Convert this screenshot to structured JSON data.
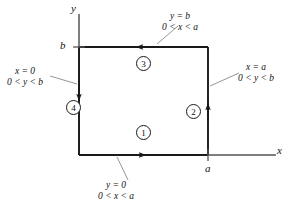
{
  "figure": {
    "colors": {
      "ink": "#111111",
      "line": "#1a1a1a",
      "leader": "#777777",
      "background": "#ffffff"
    }
  },
  "axes": {
    "y_label": "y",
    "x_label": "x"
  },
  "ticks": {
    "y_tick": "b",
    "x_tick": "a"
  },
  "segments": [
    {
      "number": "1",
      "edge": "bottom",
      "direction": "right",
      "equation": "y = 0",
      "range": "0 < x < a"
    },
    {
      "number": "2",
      "edge": "right",
      "direction": "up",
      "equation": "x = a",
      "range": "0 < y < b"
    },
    {
      "number": "3",
      "edge": "top",
      "direction": "left",
      "equation": "y = b",
      "range": "0 < x < a"
    },
    {
      "number": "4",
      "edge": "left",
      "direction": "down",
      "equation": "x = 0",
      "range": "0 < y < b"
    }
  ]
}
